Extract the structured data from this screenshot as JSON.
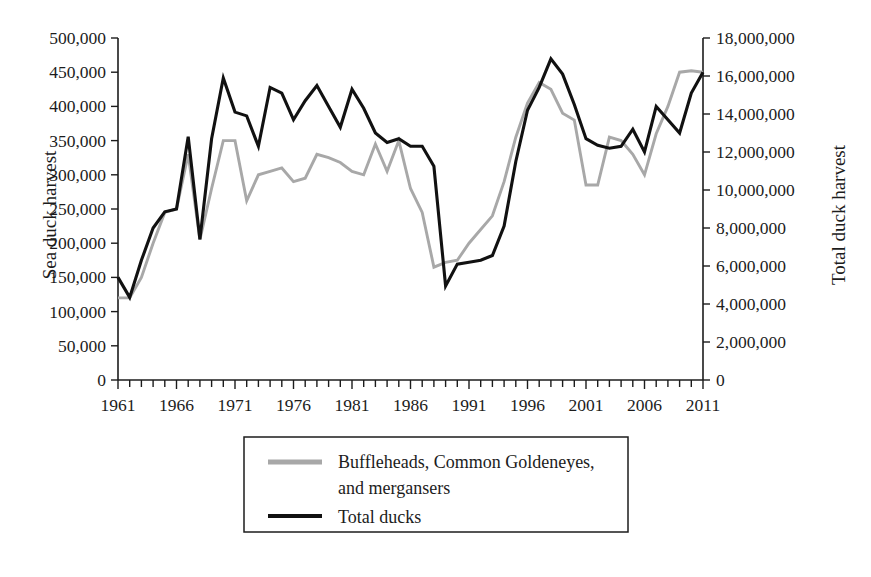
{
  "chart_data": {
    "type": "line",
    "title": "",
    "subtitle": "",
    "xlabel": "",
    "ylabel": "Sea duck harvest",
    "y2label": "Total duck harvest",
    "grid": false,
    "legend_position": "below-center",
    "xlim": [
      1961,
      2011
    ],
    "ylim": [
      0,
      500000
    ],
    "y2lim": [
      0,
      18000000
    ],
    "x_tick_step_minor": 1,
    "x_tick_labels": [
      "1961",
      "1966",
      "1971",
      "1976",
      "1981",
      "1986",
      "1991",
      "1996",
      "2001",
      "2006",
      "2011"
    ],
    "x_tick_values": [
      1961,
      1966,
      1971,
      1976,
      1981,
      1986,
      1991,
      1996,
      2001,
      2006,
      2011
    ],
    "y_tick_labels": [
      "0",
      "50,000",
      "100,000",
      "150,000",
      "200,000",
      "250,000",
      "300,000",
      "350,000",
      "400,000",
      "450,000",
      "500,000"
    ],
    "y_tick_values": [
      0,
      50000,
      100000,
      150000,
      200000,
      250000,
      300000,
      350000,
      400000,
      450000,
      500000
    ],
    "y2_tick_labels": [
      "0",
      "2,000,000",
      "4,000,000",
      "6,000,000",
      "8,000,000",
      "10,000,000",
      "12,000,000",
      "14,000,000",
      "16,000,000",
      "18,000,000"
    ],
    "y2_tick_values": [
      0,
      2000000,
      4000000,
      6000000,
      8000000,
      10000000,
      12000000,
      14000000,
      16000000,
      18000000
    ],
    "x": [
      1961,
      1962,
      1963,
      1964,
      1965,
      1966,
      1967,
      1968,
      1969,
      1970,
      1971,
      1972,
      1973,
      1974,
      1975,
      1976,
      1977,
      1978,
      1979,
      1980,
      1981,
      1982,
      1983,
      1984,
      1985,
      1986,
      1987,
      1988,
      1989,
      1990,
      1991,
      1992,
      1993,
      1994,
      1995,
      1996,
      1997,
      1998,
      1999,
      2000,
      2001,
      2002,
      2003,
      2004,
      2005,
      2006,
      2007,
      2008,
      2009,
      2010,
      2011
    ],
    "series": [
      {
        "name": "Buffleheads, Common Goldeneyes, and mergansers",
        "axis": "left",
        "color": "#a8a8a8",
        "unit": "Sea duck harvest",
        "values": [
          120000,
          120000,
          150000,
          200000,
          245000,
          250000,
          330000,
          205000,
          280000,
          350000,
          350000,
          262000,
          300000,
          305000,
          310000,
          290000,
          295000,
          330000,
          325000,
          318000,
          305000,
          300000,
          345000,
          305000,
          350000,
          280000,
          245000,
          165000,
          172000,
          175000,
          200000,
          220000,
          240000,
          290000,
          355000,
          405000,
          435000,
          425000,
          390000,
          380000,
          285000,
          285000,
          355000,
          350000,
          330000,
          300000,
          360000,
          400000,
          450000,
          452000,
          450000
        ]
      },
      {
        "name": "Total ducks",
        "axis": "right",
        "color": "#111111",
        "unit": "Total duck harvest",
        "values": [
          5400000,
          4350000,
          6300000,
          8000000,
          8850000,
          9000000,
          12800000,
          7400000,
          12700000,
          15900000,
          14100000,
          13900000,
          12300000,
          15400000,
          15100000,
          13700000,
          14700000,
          15500000,
          14400000,
          13300000,
          15300000,
          14300000,
          13000000,
          12500000,
          12700000,
          12300000,
          12300000,
          11250000,
          4950000,
          6100000,
          6200000,
          6300000,
          6550000,
          8100000,
          11500000,
          14200000,
          15400000,
          16900000,
          16100000,
          14500000,
          12700000,
          12350000,
          12200000,
          12300000,
          13200000,
          12000000,
          14400000,
          13700000,
          13000000,
          15100000,
          16200000
        ]
      }
    ],
    "annotations": []
  },
  "axes": {
    "left_title": "Sea duck harvest",
    "right_title": "Total duck harvest"
  },
  "legend": {
    "entries": [
      {
        "label_line1": "Buffleheads, Common Goldeneyes,",
        "label_line2": "and mergansers",
        "swatch": "gray-line-swatch"
      },
      {
        "label_line1": "Total ducks",
        "label_line2": "",
        "swatch": "black-line-swatch"
      }
    ]
  },
  "colors": {
    "seaduck_line": "#a8a8a8",
    "total_line": "#111111",
    "axis": "#1c1c1c",
    "background": "#ffffff"
  }
}
